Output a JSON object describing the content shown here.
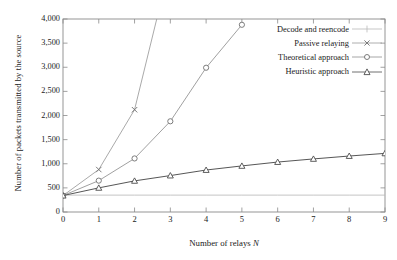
{
  "chart_data": {
    "type": "line",
    "title": "",
    "xlabel": "Number of relays N",
    "ylabel": "Number of packets transmitted by the source",
    "xlim": [
      0,
      9
    ],
    "ylim": [
      0,
      4000
    ],
    "xticks": [
      "0",
      "1",
      "2",
      "3",
      "4",
      "5",
      "6",
      "7",
      "8",
      "9"
    ],
    "yticks": [
      "0",
      "500",
      "1,000",
      "1,500",
      "2,000",
      "2,500",
      "3,000",
      "3,500",
      "4,000"
    ],
    "grid": false,
    "legend_position": "top-right-inside",
    "x": [
      0,
      1,
      2,
      3,
      4,
      5,
      6,
      7,
      8,
      9
    ],
    "series": [
      {
        "name": "Decode and reencode",
        "marker": "plus",
        "color": "#b9b9b9",
        "x": [
          0,
          1,
          2,
          3,
          4,
          5,
          6,
          7,
          8,
          9
        ],
        "values": [
          350,
          350,
          350,
          350,
          350,
          350,
          350,
          350,
          350,
          350
        ]
      },
      {
        "name": "Passive relaying",
        "marker": "cross",
        "color": "#9a9a9a",
        "x": [
          0,
          1,
          2,
          2.62
        ],
        "values": [
          340,
          880,
          2120,
          4000
        ]
      },
      {
        "name": "Theoretical approach",
        "marker": "circle",
        "color": "#8f8f8f",
        "x": [
          0,
          1,
          2,
          3,
          4,
          5
        ],
        "values": [
          340,
          650,
          1110,
          1880,
          2990,
          3880
        ]
      },
      {
        "name": "Heuristic approach",
        "marker": "triangle",
        "color": "#4d4d4d",
        "x": [
          0,
          1,
          2,
          3,
          4,
          5,
          6,
          7,
          8,
          9
        ],
        "values": [
          340,
          500,
          645,
          755,
          870,
          955,
          1035,
          1100,
          1160,
          1215
        ]
      }
    ]
  },
  "legend": {
    "items": [
      {
        "label": "Decode and reencode"
      },
      {
        "label": "Passive relaying"
      },
      {
        "label": "Theoretical approach"
      },
      {
        "label": "Heuristic approach"
      }
    ]
  },
  "axes": {
    "x_title_prefix": "Number of relays ",
    "x_title_symbol": "N",
    "y_title": "Number of packets transmitted by the source"
  }
}
